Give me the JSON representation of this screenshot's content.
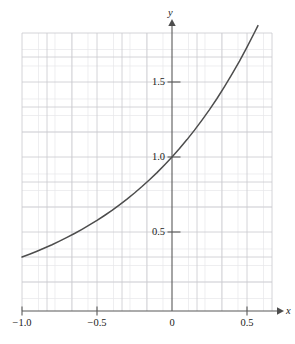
{
  "chart_data": {
    "type": "line",
    "title": "",
    "subtitle": "",
    "xlabel": "x",
    "ylabel": "y",
    "xlim": [
      -1.0,
      0.573
    ],
    "ylim": [
      0.0,
      1.853
    ],
    "xticks": [
      -1.0,
      -0.5,
      0,
      0.5
    ],
    "xtick_labels": [
      "−1.0",
      "−0.5",
      "0",
      "0.5"
    ],
    "yticks": [
      0.5,
      1.0,
      1.5
    ],
    "ytick_labels": [
      "0.5",
      "1.0",
      "1.5"
    ],
    "grid": true,
    "grid_step_x": 0.11,
    "grid_step_y": 0.11,
    "legend": null,
    "annotations": [],
    "series": [
      {
        "name": "y = 3^x",
        "color": "#4d4d4d",
        "x": [
          -1.0,
          -0.95,
          -0.9,
          -0.85,
          -0.8,
          -0.75,
          -0.7,
          -0.65,
          -0.6,
          -0.55,
          -0.5,
          -0.45,
          -0.4,
          -0.35,
          -0.3,
          -0.25,
          -0.2,
          -0.15,
          -0.1,
          -0.05,
          0.0,
          0.05,
          0.1,
          0.15,
          0.2,
          0.25,
          0.3,
          0.35,
          0.4,
          0.45,
          0.5,
          0.55,
          0.573
        ],
        "y": [
          0.333,
          0.352,
          0.372,
          0.393,
          0.415,
          0.439,
          0.464,
          0.49,
          0.518,
          0.547,
          0.577,
          0.61,
          0.644,
          0.681,
          0.719,
          0.76,
          0.803,
          0.848,
          0.896,
          0.947,
          1.0,
          1.056,
          1.116,
          1.179,
          1.246,
          1.316,
          1.39,
          1.469,
          1.552,
          1.639,
          1.732,
          1.83,
          1.876
        ]
      }
    ]
  },
  "axes": {
    "x_axis_name": "x",
    "y_axis_name": "y"
  },
  "colors": {
    "curve": "#4d4d4d",
    "axis": "#595959",
    "grid_major": "#c8c8cc",
    "grid_minor": "#e4e4e8",
    "text": "#1a1a1a",
    "background": "#ffffff"
  }
}
